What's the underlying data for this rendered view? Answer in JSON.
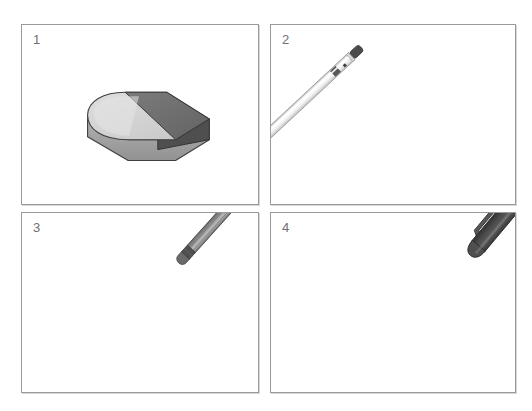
{
  "page": {
    "background_color": "#ffffff",
    "width": 532,
    "height": 411,
    "layout": "2x2-grid-of-bordered-panels",
    "border_color": "#9a9a9a",
    "label_color": "#6f6f6f"
  },
  "panels": [
    {
      "number": "1",
      "object_name": "eraser",
      "description": "Isometric rectangular eraser with one rounded end and a darker sleeve band across the middle",
      "colors": {
        "top_light": "#d3d3d3",
        "top_dark": "#6e6e6e",
        "side_light": "#a9a9a9",
        "side_dark": "#545454",
        "outline": "#3a3a3a"
      }
    },
    {
      "number": "2",
      "object_name": "mechanical-pencil",
      "description": "White/silver mechanical pencil angled from upper-left to lower-right, dark cap at top and dark conical tip at bottom",
      "colors": {
        "barrel_light": "#fdfdfd",
        "barrel_shade": "#c9c9c9",
        "cap": "#4a4a4a",
        "tip": "#5a5a5a",
        "outline": "#8a8a8a"
      }
    },
    {
      "number": "3",
      "object_name": "pencil",
      "description": "Gray hexagonal wooden pencil angled from upper-right to lower-left, dark ferrule and eraser at top, sharpened graphite point at bottom",
      "colors": {
        "body_light": "#b4b4b4",
        "body_mid": "#8e8e8e",
        "body_dark": "#6a6a6a",
        "ferrule": "#4f4f4f",
        "eraser": "#636363",
        "wood": "#c3c3c3",
        "graphite": "#3b3b3b",
        "outline": "#4a4a4a"
      }
    },
    {
      "number": "4",
      "object_name": "ballpoint-pen",
      "description": "Dark gray pen with pocket clip at upper-right, dark grip rings and a silver conical nose section with a fine metal point at lower-left",
      "colors": {
        "body_dark": "#4d4d4d",
        "body_darker": "#3a3a3a",
        "clip": "#5a5a5a",
        "grip_ring": "#2f2f2f",
        "nose_silver": "#d2d2d2",
        "nose_shade": "#9a9a9a",
        "point": "#6a6a6a",
        "outline": "#303030"
      }
    }
  ]
}
